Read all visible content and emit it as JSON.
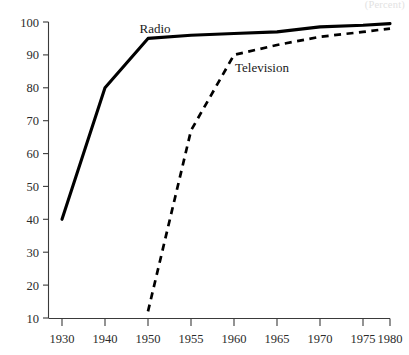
{
  "caption": {
    "partial_top_text": "(Percent)"
  },
  "chart_data": {
    "type": "line",
    "title": "",
    "subtitle": "",
    "xlabel": "",
    "ylabel": "",
    "grid": false,
    "legend_position": "inline-annotations",
    "x": [
      "1930",
      "1940",
      "1950",
      "1955",
      "1960",
      "1965",
      "1970",
      "1975",
      "1980"
    ],
    "x_tick_labels": [
      "1930",
      "1940",
      "1950",
      "1955",
      "1960",
      "1965",
      "1970",
      "1975",
      "1980"
    ],
    "y_tick_labels": [
      "10",
      "20",
      "30",
      "40",
      "50",
      "60",
      "70",
      "80",
      "90",
      "100"
    ],
    "y_ticks": [
      10,
      20,
      30,
      40,
      50,
      60,
      70,
      80,
      90,
      100
    ],
    "ylim": [
      10,
      100
    ],
    "series": [
      {
        "name": "Radio",
        "style": "solid",
        "values": [
          40,
          80,
          95,
          96,
          96.5,
          97,
          98.5,
          99,
          99.5
        ]
      },
      {
        "name": "Television",
        "style": "dashed",
        "values": [
          null,
          null,
          12,
          67,
          90,
          93,
          95.5,
          97,
          98
        ]
      }
    ],
    "annotations": [
      {
        "text": "Radio",
        "x": "1943",
        "y": 99
      },
      {
        "text": "Television",
        "x": "1962",
        "y": 85
      }
    ]
  }
}
